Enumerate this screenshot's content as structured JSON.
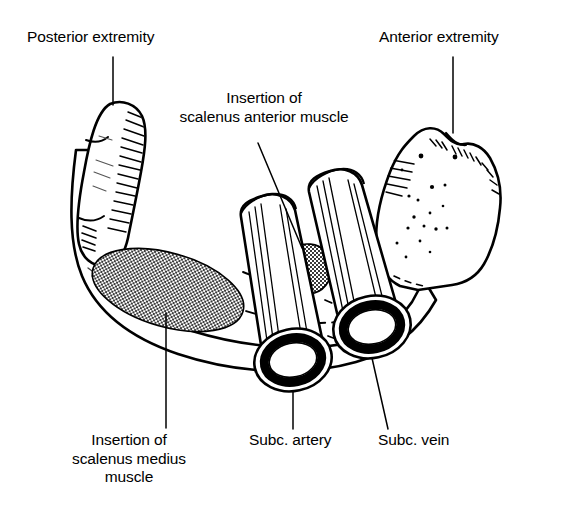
{
  "figure": {
    "view": "superior view of right clavicle, anterior to the right",
    "background_color": "#ffffff",
    "ink_color": "#000000",
    "shading_color": "#808080"
  },
  "labels": {
    "posterior_extremity": "Posterior extremity",
    "anterior_extremity": "Anterior extremity",
    "scalenus_anterior_line1": "Insertion of",
    "scalenus_anterior_line2": "scalenus anterior muscle",
    "scalenus_medius_line1": "Insertion of",
    "scalenus_medius_line2": "scalenus medius",
    "scalenus_medius_line3": "muscle",
    "subclavian_artery": "Subc. artery",
    "subclavian_vein": "Subc. vein"
  },
  "structures": [
    {
      "name": "clavicle",
      "kind": "bone",
      "fill": "#ffffff",
      "stroke": "#000000"
    },
    {
      "name": "posterior-extremity",
      "kind": "bone-end",
      "fill": "#ffffff",
      "stroke": "#000000"
    },
    {
      "name": "anterior-extremity",
      "kind": "bone-end",
      "fill": "#ffffff",
      "stroke": "#000000"
    },
    {
      "name": "scalenus-medius-insertion",
      "kind": "muscle-attachment",
      "fill": "#808080",
      "shape": "ellipse"
    },
    {
      "name": "scalenus-anterior-insertion",
      "kind": "muscle-attachment",
      "fill": "#808080",
      "shape": "blob"
    },
    {
      "name": "subclavian-artery",
      "kind": "vessel",
      "fill": "#ffffff",
      "stroke": "#000000",
      "shape": "cylinder"
    },
    {
      "name": "subclavian-vein",
      "kind": "vessel",
      "fill": "#ffffff",
      "stroke": "#000000",
      "shape": "cylinder"
    }
  ]
}
